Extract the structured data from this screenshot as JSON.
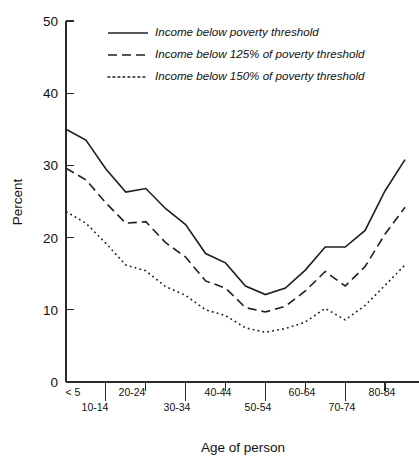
{
  "chart_data": {
    "type": "line",
    "title": "",
    "xlabel": "Age of person",
    "ylabel": "Percent",
    "ylim": [
      0,
      50
    ],
    "yticks": [
      0,
      10,
      20,
      30,
      40,
      50
    ],
    "grid": false,
    "legend_position": "top-center",
    "categories": [
      "< 5",
      "5-9",
      "10-14",
      "15-19",
      "20-24",
      "25-29",
      "30-34",
      "35-39",
      "40-44",
      "45-49",
      "50-54",
      "55-59",
      "60-64",
      "65-69",
      "70-74",
      "75-79",
      "80-84",
      "85+"
    ],
    "xtick_labels_row1": [
      "< 5",
      "20-24",
      "40-44",
      "60-64",
      "80-84"
    ],
    "xtick_labels_row2": [
      "10-14",
      "30-34",
      "50-54",
      "70-74"
    ],
    "series": [
      {
        "name": "Income below poverty threshold",
        "style": "solid",
        "values": [
          35.0,
          33.5,
          29.5,
          26.3,
          26.8,
          24.0,
          21.8,
          17.8,
          16.5,
          13.3,
          12.1,
          13.0,
          15.5,
          18.7,
          18.7,
          21.0,
          26.5,
          30.8
        ]
      },
      {
        "name": "Income below 125% of poverty threshold",
        "style": "dashed",
        "values": [
          29.6,
          28.0,
          24.8,
          22.0,
          22.2,
          19.3,
          17.3,
          14.0,
          13.0,
          10.3,
          9.7,
          10.5,
          12.6,
          15.3,
          13.3,
          16.0,
          20.5,
          24.2
        ]
      },
      {
        "name": "Income below 150% of poverty threshold",
        "style": "dotted",
        "values": [
          23.6,
          22.0,
          19.2,
          16.2,
          15.4,
          13.2,
          12.0,
          10.0,
          9.2,
          7.5,
          6.9,
          7.4,
          8.3,
          10.2,
          8.6,
          10.6,
          13.4,
          16.2
        ]
      }
    ],
    "extra_right_points": {
      "note": "series extend to final age group at right edge",
      "solid_end": 39.0,
      "dashed_end": 29.0,
      "dotted_end": 19.8
    },
    "colors": {
      "line": "#1f1f1f",
      "axis": "#2b2b2b",
      "background": "#ffffff"
    }
  },
  "legend": {
    "items": [
      {
        "label": "Income below poverty threshold",
        "style": "solid"
      },
      {
        "label": "Income below 125% of poverty threshold",
        "style": "dashed"
      },
      {
        "label": "Income below 150% of poverty threshold",
        "style": "dotted"
      }
    ]
  }
}
